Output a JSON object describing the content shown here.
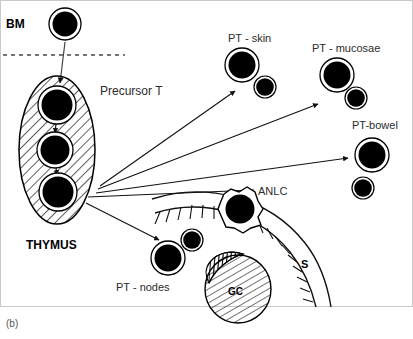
{
  "figure": {
    "caption": "(b)",
    "frame_color": "#c9c9c9",
    "background": "#ffffff",
    "ink_color": "#000000"
  },
  "labels": {
    "bm": "BM",
    "precursor_t": "Precursor T",
    "thymus": "THYMUS",
    "pt_skin": "PT - skin",
    "pt_mucosae": "PT - mucosae",
    "pt_bowel": "PT-bowel",
    "pt_nodes": "PT - nodes",
    "anlc": "ANLC",
    "s": "S",
    "gc": "GC"
  },
  "nodes": [
    {
      "id": "bm-stem-cell",
      "name": "bone-marrow-stem-cell",
      "label": "BM",
      "cx": 65,
      "cy": 24,
      "r_outer": 16,
      "r_inner": 12.5,
      "style": "ringed-black-circle"
    },
    {
      "id": "thymus-organ",
      "name": "thymus-ellipse",
      "label": "THYMUS",
      "cx": 57,
      "cy": 150,
      "rx": 38,
      "ry": 74,
      "style": "hatched-ellipse"
    },
    {
      "id": "thymocyte-1",
      "name": "thymocyte-upper",
      "cx": 57,
      "cy": 105,
      "r_outer": 19,
      "r_inner": 15.5,
      "style": "ringed-black-circle"
    },
    {
      "id": "thymocyte-2",
      "name": "thymocyte-middle",
      "cx": 55,
      "cy": 150,
      "r_outer": 18,
      "r_inner": 14.5,
      "style": "ringed-black-circle"
    },
    {
      "id": "thymocyte-3",
      "name": "thymocyte-lower",
      "cx": 58,
      "cy": 192,
      "r_outer": 19,
      "r_inner": 15.5,
      "style": "ringed-black-circle"
    },
    {
      "id": "pt-skin-large",
      "name": "pt-skin-large-cell",
      "cx": 242,
      "cy": 65,
      "r_outer": 17,
      "r_inner": 13.5,
      "style": "ringed-black-circle"
    },
    {
      "id": "pt-skin-small",
      "name": "pt-skin-small-cell",
      "cx": 265,
      "cy": 87,
      "r_outer": 11,
      "r_inner": 9,
      "style": "ringed-black-circle"
    },
    {
      "id": "pt-mucosae-large",
      "name": "pt-mucosae-large-cell",
      "cx": 337,
      "cy": 75,
      "r_outer": 17,
      "r_inner": 13.5,
      "style": "ringed-black-circle"
    },
    {
      "id": "pt-mucosae-small",
      "name": "pt-mucosae-small-cell",
      "cx": 356,
      "cy": 98,
      "r_outer": 11,
      "r_inner": 9,
      "style": "ringed-black-circle"
    },
    {
      "id": "pt-bowel-large",
      "name": "pt-bowel-large-cell",
      "cx": 372,
      "cy": 155,
      "r_outer": 17,
      "r_inner": 13.5,
      "style": "ringed-black-circle"
    },
    {
      "id": "pt-bowel-small",
      "name": "pt-bowel-small-cell",
      "cx": 363,
      "cy": 188,
      "r_outer": 11,
      "r_inner": 9,
      "style": "ringed-black-circle"
    },
    {
      "id": "pt-nodes-large",
      "name": "pt-nodes-large-cell",
      "cx": 168,
      "cy": 258,
      "r_outer": 17,
      "r_inner": 13.5,
      "style": "ringed-black-circle"
    },
    {
      "id": "pt-nodes-small",
      "name": "pt-nodes-small-cell",
      "cx": 192,
      "cy": 240,
      "r_outer": 11,
      "r_inner": 9,
      "style": "ringed-black-circle"
    },
    {
      "id": "anlc-cell",
      "name": "anlc-cell",
      "label": "ANLC",
      "cx": 240,
      "cy": 209,
      "r_outer": 17,
      "r_inner": 14,
      "style": "black-circle-with-dendritic-outline"
    },
    {
      "id": "germinal-center",
      "name": "germinal-center",
      "label": "GC",
      "cx": 237,
      "cy": 288,
      "rx": 33,
      "ry": 34,
      "style": "hatched-circle-with-mantle"
    }
  ],
  "connectors": [
    {
      "id": "bm-to-thymus",
      "name": "arrow-bm-to-thymus",
      "from": "bm-stem-cell",
      "to": "thymus-organ",
      "kind": "arrow",
      "x1": 65,
      "y1": 42,
      "x2": 60,
      "y2": 82
    },
    {
      "id": "thymocyte1-to-2",
      "name": "arrow-thymocyte-1-to-2",
      "kind": "arrow",
      "x1": 56,
      "y1": 124,
      "x2": 55,
      "y2": 132
    },
    {
      "id": "thymocyte2-to-3",
      "name": "arrow-thymocyte-2-to-3",
      "kind": "arrow",
      "x1": 56,
      "y1": 168,
      "x2": 57,
      "y2": 174
    },
    {
      "id": "thymus-to-pt-skin",
      "name": "arrow-thymus-to-pt-skin",
      "kind": "arrow",
      "x1": 100,
      "y1": 185,
      "x2": 236,
      "y2": 90
    },
    {
      "id": "thymus-to-pt-mucosae",
      "name": "arrow-thymus-to-pt-mucosae",
      "kind": "arrow",
      "x1": 98,
      "y1": 188,
      "x2": 319,
      "y2": 103
    },
    {
      "id": "thymus-to-pt-bowel",
      "name": "arrow-thymus-to-pt-bowel",
      "kind": "arrow",
      "x1": 96,
      "y1": 192,
      "x2": 349,
      "y2": 167
    },
    {
      "id": "thymus-to-anlc",
      "name": "arrow-thymus-to-anlc",
      "kind": "line",
      "x1": 86,
      "y1": 197,
      "x2": 252,
      "y2": 189
    },
    {
      "id": "thymus-to-pt-nodes",
      "name": "arrow-thymus-to-pt-nodes",
      "kind": "arrow",
      "x1": 86,
      "y1": 204,
      "x2": 160,
      "y2": 240
    }
  ],
  "decorations": {
    "bm_dashed_line": {
      "name": "basement-membrane-dashed-line",
      "x1": 3,
      "y1": 55,
      "x2": 125,
      "y2": 55,
      "dash": "4 4"
    },
    "mucosal_arc": {
      "name": "mucosal-surface-arc",
      "description": "curved epithelial surface with villi tick marks",
      "villi_count": 17
    }
  },
  "text_positions": {
    "bm": {
      "x": 6,
      "y": 28,
      "size": 12,
      "weight": "bold"
    },
    "precursor_t": {
      "x": 100,
      "y": 95,
      "size": 12,
      "weight": "normal"
    },
    "thymus": {
      "x": 26,
      "y": 249,
      "size": 12,
      "weight": "bold"
    },
    "pt_skin": {
      "x": 228,
      "y": 42,
      "size": 11,
      "weight": "normal"
    },
    "pt_mucosae": {
      "x": 314,
      "y": 52,
      "size": 11,
      "weight": "normal"
    },
    "pt_bowel": {
      "x": 353,
      "y": 129,
      "size": 11,
      "weight": "normal"
    },
    "pt_nodes": {
      "x": 117,
      "y": 290,
      "size": 11,
      "weight": "normal"
    },
    "anlc": {
      "x": 259,
      "y": 195,
      "size": 11,
      "weight": "normal"
    },
    "s": {
      "x": 303,
      "y": 267,
      "size": 11,
      "weight": "bold"
    },
    "gc": {
      "x": 229,
      "y": 295,
      "size": 10,
      "weight": "bold"
    },
    "caption": {
      "x": 6,
      "y": 326,
      "size": 10,
      "weight": "normal"
    }
  }
}
